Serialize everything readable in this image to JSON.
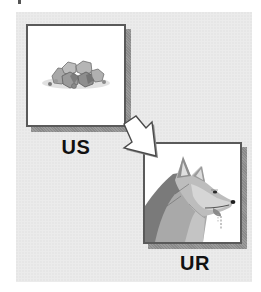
{
  "diagram": {
    "type": "classical-conditioning",
    "stimulus": {
      "label": "US",
      "image": "food-pellets-icon"
    },
    "response": {
      "label": "UR",
      "image": "salivating-dog-icon"
    },
    "arrow": {
      "from": "US",
      "to": "UR",
      "direction": "down-right"
    },
    "colors": {
      "panel_background": "#ebebeb",
      "frame_border": "#5a5a5a",
      "frame_shadow": "#8a8a8a",
      "label_text": "#111111"
    }
  }
}
